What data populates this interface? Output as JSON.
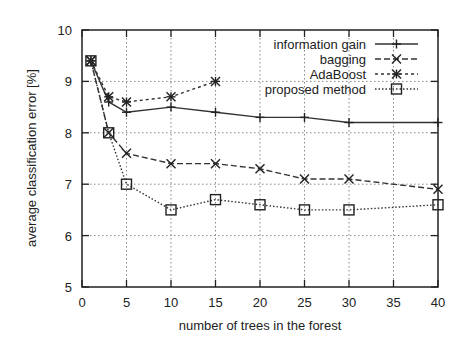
{
  "chart_data": {
    "type": "line",
    "title": "",
    "xlabel": "number of trees in the forest",
    "ylabel": "average classification error [%]",
    "xlim": [
      0,
      40
    ],
    "ylim": [
      5,
      10
    ],
    "xticks": [
      0,
      5,
      10,
      15,
      20,
      25,
      30,
      35,
      40
    ],
    "yticks": [
      5,
      6,
      7,
      8,
      9,
      10
    ],
    "grid": true,
    "legend_position": "upper right",
    "series": [
      {
        "name": "information gain",
        "style": "solid",
        "marker": "plus",
        "x": [
          1,
          3,
          5,
          10,
          15,
          20,
          25,
          30,
          40
        ],
        "values": [
          9.4,
          8.6,
          8.4,
          8.5,
          8.4,
          8.3,
          8.3,
          8.2,
          8.2
        ]
      },
      {
        "name": "bagging",
        "style": "dashed",
        "marker": "x",
        "x": [
          1,
          3,
          5,
          10,
          15,
          20,
          25,
          30,
          40
        ],
        "values": [
          9.4,
          8.0,
          7.6,
          7.4,
          7.4,
          7.3,
          7.1,
          7.1,
          6.9
        ]
      },
      {
        "name": "AdaBoost",
        "style": "short-dashed",
        "marker": "star",
        "x": [
          1,
          3,
          5,
          10,
          15
        ],
        "values": [
          9.4,
          8.7,
          8.6,
          8.7,
          9.0
        ]
      },
      {
        "name": "proposed method",
        "style": "dotted",
        "marker": "square",
        "x": [
          1,
          3,
          5,
          10,
          15,
          20,
          25,
          30,
          40
        ],
        "values": [
          9.4,
          8.0,
          7.0,
          6.5,
          6.7,
          6.6,
          6.5,
          6.5,
          6.6
        ]
      }
    ]
  }
}
